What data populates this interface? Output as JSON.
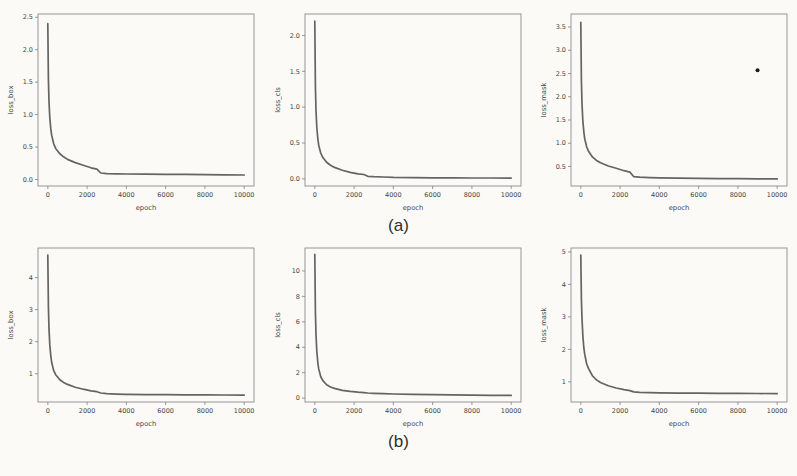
{
  "captions": {
    "a": "(a)",
    "b": "(b)"
  },
  "colors": {
    "curve": "#4f4e4e",
    "axis": "#8c8c8c",
    "text": "#454545",
    "outlier": "#1c1c1c",
    "paper": "#fbfaf6"
  },
  "chart_data": [
    {
      "type": "line",
      "row": "a",
      "title": "",
      "ylabel": "loss_box",
      "xlabel": "epoch",
      "xlim": [
        -500,
        10500
      ],
      "ylim": [
        -0.1,
        2.55
      ],
      "xticks": [
        0,
        2000,
        4000,
        6000,
        8000,
        10000
      ],
      "xtick_labels": [
        "0",
        "2000",
        "4000",
        "6000",
        "8000",
        "10000"
      ],
      "yticks": [
        0.0,
        0.5,
        1.0,
        1.5,
        2.0,
        2.5
      ],
      "ytick_labels": [
        "0.0",
        "0.5",
        "1.0",
        "1.5",
        "2.0",
        "2.5"
      ],
      "grid": false,
      "legend": null,
      "x": [
        0,
        30,
        60,
        100,
        150,
        200,
        300,
        400,
        600,
        800,
        1000,
        1400,
        1800,
        2200,
        2500,
        2700,
        3000,
        3500,
        4000,
        5000,
        6000,
        7000,
        8000,
        9000,
        10000
      ],
      "y": [
        2.4,
        1.55,
        1.2,
        0.95,
        0.78,
        0.68,
        0.55,
        0.48,
        0.4,
        0.35,
        0.31,
        0.26,
        0.22,
        0.18,
        0.16,
        0.1,
        0.09,
        0.088,
        0.085,
        0.082,
        0.08,
        0.078,
        0.076,
        0.073,
        0.07
      ]
    },
    {
      "type": "line",
      "row": "a",
      "title": "",
      "ylabel": "loss_cls",
      "xlabel": "epoch",
      "xlim": [
        -500,
        10500
      ],
      "ylim": [
        -0.1,
        2.3
      ],
      "xticks": [
        0,
        2000,
        4000,
        6000,
        8000,
        10000
      ],
      "xtick_labels": [
        "0",
        "2000",
        "4000",
        "6000",
        "8000",
        "10000"
      ],
      "yticks": [
        0.0,
        0.5,
        1.0,
        1.5,
        2.0
      ],
      "ytick_labels": [
        "0.0",
        "0.5",
        "1.0",
        "1.5",
        "2.0"
      ],
      "grid": false,
      "legend": null,
      "x": [
        0,
        30,
        60,
        100,
        150,
        200,
        300,
        400,
        600,
        800,
        1000,
        1400,
        1800,
        2200,
        2500,
        2700,
        3000,
        3500,
        4000,
        5000,
        6000,
        7000,
        8000,
        9000,
        10000
      ],
      "y": [
        2.2,
        1.3,
        0.95,
        0.72,
        0.56,
        0.47,
        0.36,
        0.3,
        0.23,
        0.19,
        0.16,
        0.12,
        0.09,
        0.07,
        0.06,
        0.035,
        0.03,
        0.025,
        0.02,
        0.017,
        0.015,
        0.013,
        0.012,
        0.011,
        0.01
      ]
    },
    {
      "type": "line",
      "row": "a",
      "title": "",
      "ylabel": "loss_mask",
      "xlabel": "epoch",
      "xlim": [
        -500,
        10500
      ],
      "ylim": [
        0.08,
        3.78
      ],
      "xticks": [
        0,
        2000,
        4000,
        6000,
        8000,
        10000
      ],
      "xtick_labels": [
        "0",
        "2000",
        "4000",
        "6000",
        "8000",
        "10000"
      ],
      "yticks": [
        0.5,
        1.0,
        1.5,
        2.0,
        2.5,
        3.0,
        3.5
      ],
      "ytick_labels": [
        "0.5",
        "1.0",
        "1.5",
        "2.0",
        "2.5",
        "3.0",
        "3.5"
      ],
      "grid": false,
      "legend": null,
      "outlier": {
        "x": 9000,
        "y": 2.57
      },
      "x": [
        0,
        30,
        60,
        100,
        150,
        200,
        300,
        400,
        600,
        800,
        1000,
        1400,
        1800,
        2200,
        2500,
        2700,
        3000,
        3500,
        4000,
        5000,
        6000,
        7000,
        8000,
        9000,
        10000
      ],
      "y": [
        3.6,
        2.35,
        1.85,
        1.5,
        1.25,
        1.1,
        0.92,
        0.82,
        0.7,
        0.63,
        0.58,
        0.51,
        0.46,
        0.41,
        0.38,
        0.28,
        0.27,
        0.26,
        0.255,
        0.25,
        0.245,
        0.24,
        0.238,
        0.235,
        0.232
      ]
    },
    {
      "type": "line",
      "row": "b",
      "title": "",
      "ylabel": "loss_box",
      "xlabel": "epoch",
      "xlim": [
        -500,
        10500
      ],
      "ylim": [
        0.12,
        4.92
      ],
      "xticks": [
        0,
        2000,
        4000,
        6000,
        8000,
        10000
      ],
      "xtick_labels": [
        "0",
        "2000",
        "4000",
        "6000",
        "8000",
        "10000"
      ],
      "yticks": [
        1,
        2,
        3,
        4
      ],
      "ytick_labels": [
        "1",
        "2",
        "3",
        "4"
      ],
      "grid": false,
      "legend": null,
      "x": [
        0,
        30,
        60,
        100,
        150,
        200,
        300,
        400,
        600,
        800,
        1000,
        1400,
        1800,
        2200,
        2500,
        2700,
        3000,
        3500,
        4000,
        5000,
        6000,
        7000,
        8000,
        9000,
        10000
      ],
      "y": [
        4.7,
        3.1,
        2.4,
        1.9,
        1.55,
        1.35,
        1.1,
        0.97,
        0.82,
        0.73,
        0.67,
        0.58,
        0.52,
        0.47,
        0.44,
        0.4,
        0.38,
        0.365,
        0.36,
        0.352,
        0.348,
        0.344,
        0.34,
        0.337,
        0.334
      ]
    },
    {
      "type": "line",
      "row": "b",
      "title": "",
      "ylabel": "loss_cls",
      "xlabel": "epoch",
      "xlim": [
        -500,
        10500
      ],
      "ylim": [
        -0.3,
        11.8
      ],
      "xticks": [
        0,
        2000,
        4000,
        6000,
        8000,
        10000
      ],
      "xtick_labels": [
        "0",
        "2000",
        "4000",
        "6000",
        "8000",
        "10000"
      ],
      "yticks": [
        0,
        2,
        4,
        6,
        8,
        10
      ],
      "ytick_labels": [
        "0",
        "2",
        "4",
        "6",
        "8",
        "10"
      ],
      "grid": false,
      "legend": null,
      "x": [
        0,
        30,
        60,
        100,
        150,
        200,
        300,
        400,
        600,
        800,
        1000,
        1400,
        1800,
        2200,
        2500,
        2700,
        3000,
        3500,
        4000,
        5000,
        6000,
        7000,
        8000,
        9000,
        10000
      ],
      "y": [
        11.3,
        6.8,
        5.0,
        3.7,
        2.8,
        2.3,
        1.7,
        1.4,
        1.05,
        0.88,
        0.77,
        0.62,
        0.53,
        0.47,
        0.44,
        0.41,
        0.38,
        0.35,
        0.33,
        0.3,
        0.28,
        0.26,
        0.245,
        0.23,
        0.22
      ]
    },
    {
      "type": "line",
      "row": "b",
      "title": "",
      "ylabel": "loss_mask",
      "xlabel": "epoch",
      "xlim": [
        -500,
        10500
      ],
      "ylim": [
        0.38,
        5.12
      ],
      "xticks": [
        0,
        2000,
        4000,
        6000,
        8000,
        10000
      ],
      "xtick_labels": [
        "0",
        "2000",
        "4000",
        "6000",
        "8000",
        "10000"
      ],
      "yticks": [
        1,
        2,
        3,
        4,
        5
      ],
      "ytick_labels": [
        "1",
        "2",
        "3",
        "4",
        "5"
      ],
      "grid": false,
      "legend": null,
      "x": [
        0,
        30,
        60,
        100,
        150,
        200,
        300,
        400,
        600,
        800,
        1000,
        1400,
        1800,
        2200,
        2500,
        2700,
        3000,
        3500,
        4000,
        5000,
        6000,
        7000,
        8000,
        9000,
        10000
      ],
      "y": [
        4.9,
        3.55,
        2.95,
        2.45,
        2.05,
        1.85,
        1.55,
        1.4,
        1.18,
        1.06,
        0.98,
        0.88,
        0.81,
        0.76,
        0.73,
        0.69,
        0.675,
        0.668,
        0.662,
        0.655,
        0.65,
        0.647,
        0.644,
        0.641,
        0.638
      ]
    }
  ]
}
